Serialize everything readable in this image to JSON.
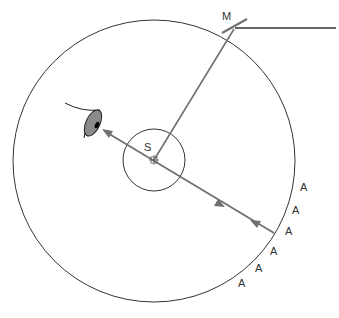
{
  "diagram": {
    "colors": {
      "circle": "#333333",
      "ray": "#707070",
      "mirror": "#707070",
      "beam": "#333333",
      "eye_fill": "#8a8a8a",
      "pupil": "#000000"
    },
    "labels": {
      "mirror": "M",
      "source": "S",
      "observers": [
        "A",
        "A",
        "A",
        "A",
        "A",
        "A"
      ]
    },
    "elements": {
      "outer_circle": {
        "cx": 154,
        "cy": 161,
        "r": 141
      },
      "inner_circle": {
        "cx": 154,
        "cy": 160,
        "r": 31
      },
      "mirror": {
        "x1": 222,
        "y1": 33,
        "x2": 247,
        "y2": 19
      },
      "incoming_beam": {
        "x1": 235,
        "y1": 28,
        "x2": 336,
        "y2": 28
      },
      "source_to_mirror_ray": {
        "x1": 154,
        "y1": 160,
        "x2": 234,
        "y2": 29
      },
      "sight_line": {
        "x1": 103,
        "y1": 130,
        "x2": 274,
        "y2": 233
      },
      "eye": {
        "x": 90,
        "y": 122
      }
    }
  }
}
